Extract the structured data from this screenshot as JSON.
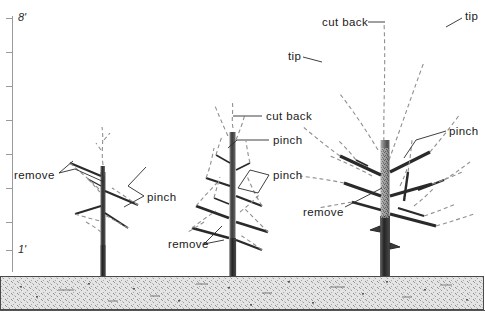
{
  "figure": {
    "background_color": "#ffffff",
    "ink_color": "#1a1a1a",
    "soil_color": "#d8d8d8",
    "dashed_growth_color": "#8c8c8c"
  },
  "scale": {
    "name": "height-scale-ruler",
    "top_label": "8'",
    "bottom_label": "1'",
    "unit": "feet",
    "tick_count": 8,
    "ticks": [
      {
        "label": "8'",
        "y": 18
      },
      {
        "label": "",
        "y": 52
      },
      {
        "label": "",
        "y": 86
      },
      {
        "label": "",
        "y": 120
      },
      {
        "label": "",
        "y": 154
      },
      {
        "label": "",
        "y": 188
      },
      {
        "label": "",
        "y": 222
      },
      {
        "label": "1'",
        "y": 250
      }
    ]
  },
  "ground": {
    "name": "soil-band",
    "top_y": 276,
    "height": 33,
    "texture": "stipple"
  },
  "trees": [
    {
      "id": "tree-year-1",
      "stage": "year 1 — newly planted whip",
      "trunk_x": 103,
      "base_y": 276,
      "top_y": 150
    },
    {
      "id": "tree-year-2",
      "stage": "year 2 — scaffolds forming",
      "trunk_x": 232,
      "base_y": 276,
      "top_y": 108
    },
    {
      "id": "tree-year-3",
      "stage": "year 3 — established framework",
      "trunk_x": 385,
      "base_y": 276,
      "top_y": 12
    }
  ],
  "annotations": [
    {
      "id": "ann-remove-left",
      "text": "remove",
      "x": 14,
      "y": 170,
      "tree": "tree-year-1"
    },
    {
      "id": "ann-pinch-left",
      "text": "pinch",
      "x": 147,
      "y": 192,
      "tree": "tree-year-1"
    },
    {
      "id": "ann-cutback-mid",
      "text": "cut back",
      "x": 266,
      "y": 112,
      "tree": "tree-year-2"
    },
    {
      "id": "ann-pinch-mid-1",
      "text": "pinch",
      "x": 273,
      "y": 136,
      "tree": "tree-year-2"
    },
    {
      "id": "ann-pinch-mid-2",
      "text": "pinch",
      "x": 273,
      "y": 171,
      "tree": "tree-year-2"
    },
    {
      "id": "ann-remove-mid",
      "text": "remove",
      "x": 168,
      "y": 241,
      "tree": "tree-year-2"
    },
    {
      "id": "ann-cutback-right",
      "text": "cut back",
      "x": 322,
      "y": 18,
      "tree": "tree-year-3"
    },
    {
      "id": "ann-tip-mid",
      "text": "tip",
      "x": 288,
      "y": 52,
      "tree": "tree-year-3"
    },
    {
      "id": "ann-tip-right",
      "text": "tip",
      "x": 465,
      "y": 12,
      "tree": "tree-year-3"
    },
    {
      "id": "ann-pinch-right",
      "text": "pinch",
      "x": 449,
      "y": 127,
      "tree": "tree-year-3"
    },
    {
      "id": "ann-remove-right",
      "text": "remove",
      "x": 303,
      "y": 208,
      "tree": "tree-year-3"
    }
  ]
}
